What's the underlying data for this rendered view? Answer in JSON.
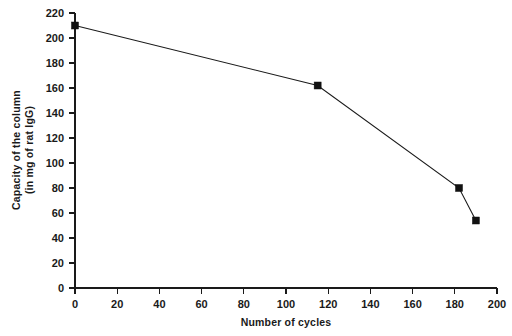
{
  "chart_data": {
    "type": "line",
    "title": "",
    "xlabel": "Number of cycles",
    "ylabel_line1": "Capacity of the column",
    "ylabel_line2": "(in mg of rat IgG)",
    "xlim": [
      0,
      200
    ],
    "ylim": [
      0,
      220
    ],
    "xticks": [
      0,
      20,
      40,
      60,
      80,
      100,
      120,
      140,
      160,
      180,
      200
    ],
    "yticks": [
      0,
      20,
      40,
      60,
      80,
      100,
      120,
      140,
      160,
      180,
      200,
      220
    ],
    "xtick_labels": [
      "0",
      "20",
      "40",
      "60",
      "80",
      "100",
      "120",
      "140",
      "160",
      "180",
      "200"
    ],
    "ytick_labels": [
      "0",
      "20",
      "40",
      "60",
      "80",
      "100",
      "120",
      "140",
      "160",
      "180",
      "200",
      "220"
    ],
    "grid": false,
    "legend": false,
    "marker": "filled-square",
    "line_color": "#1a1a1a",
    "marker_color": "#111111",
    "background": "#ffffff",
    "x": [
      0,
      115,
      182,
      190
    ],
    "y": [
      210,
      162,
      80,
      54
    ],
    "series": [
      {
        "name": "Column capacity",
        "points": [
          {
            "x": 0,
            "y": 210
          },
          {
            "x": 115,
            "y": 162
          },
          {
            "x": 182,
            "y": 80
          },
          {
            "x": 190,
            "y": 54
          }
        ]
      }
    ]
  }
}
